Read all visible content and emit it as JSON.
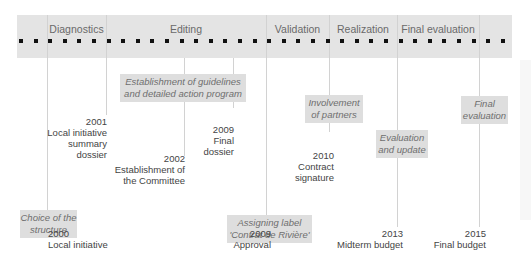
{
  "phases": [
    {
      "label": "Diagnostics",
      "left": 47,
      "width": 59
    },
    {
      "label": "Editing",
      "left": 106,
      "width": 160
    },
    {
      "label": "Validation",
      "left": 266,
      "width": 63
    },
    {
      "label": "Realization",
      "left": 329,
      "width": 68
    },
    {
      "label": "Final evaluation",
      "left": 397,
      "width": 82
    }
  ],
  "dots": {
    "count": 34,
    "start": 2,
    "spacing": 14.6
  },
  "vlines": [
    {
      "x": 47,
      "top": 15,
      "height": 212
    },
    {
      "x": 106,
      "top": 15,
      "height": 100
    },
    {
      "x": 184,
      "top": 58,
      "height": 98
    },
    {
      "x": 233,
      "top": 58,
      "height": 50
    },
    {
      "x": 266,
      "top": 15,
      "height": 212
    },
    {
      "x": 329,
      "top": 15,
      "height": 117
    },
    {
      "x": 397,
      "top": 15,
      "height": 212
    },
    {
      "x": 479,
      "top": 15,
      "height": 212
    }
  ],
  "activities": [
    {
      "text": "Establishment of guidelines\nand detailed action program",
      "left": 120,
      "top": 74,
      "width": 126,
      "height": 28
    },
    {
      "text": "Choice of the\nstructure",
      "left": 20,
      "top": 210,
      "width": 57,
      "height": 28
    },
    {
      "text": "Assigning label\n'Contrat de Rivière'",
      "left": 227,
      "top": 215,
      "width": 85,
      "height": 28
    },
    {
      "text": "Involvement\nof partners",
      "left": 305,
      "top": 95,
      "width": 58,
      "height": 28
    },
    {
      "text": "Evaluation\nand update",
      "left": 376,
      "top": 130,
      "width": 52,
      "height": 28
    },
    {
      "text": "Final\nevaluation",
      "left": 461,
      "top": 96,
      "width": 47,
      "height": 28
    }
  ],
  "milestones": [
    {
      "year": "2001",
      "label": "Local initiative\nsummary\ndossier",
      "align": "right",
      "right_x": 107,
      "top": 116
    },
    {
      "year": "2009",
      "label": "Final\ndossier",
      "align": "right",
      "right_x": 234,
      "top": 124
    },
    {
      "year": "2002",
      "label": "Establishment of\nthe Committee",
      "align": "right",
      "right_x": 185,
      "top": 153
    },
    {
      "year": "2010",
      "label": "Contract\nsignature",
      "align": "right",
      "right_x": 334,
      "top": 150
    },
    {
      "year": "2000",
      "label": "Local initiative",
      "align": "left",
      "left_x": 48,
      "top": 228
    },
    {
      "year": "2009",
      "label": "Approval",
      "align": "right",
      "right_x": 271,
      "top": 228
    },
    {
      "year": "2013",
      "label": "Midterm budget",
      "align": "right",
      "right_x": 403,
      "top": 228
    },
    {
      "year": "2015",
      "label": "Final budget",
      "align": "right",
      "right_x": 486,
      "top": 228
    }
  ]
}
